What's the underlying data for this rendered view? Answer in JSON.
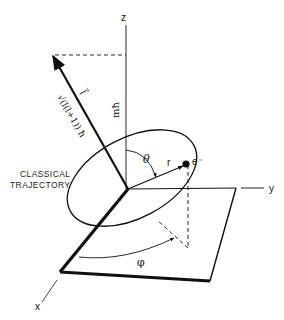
{
  "diagram": {
    "labels": {
      "z_axis": "z",
      "y_axis": "y",
      "x_axis": "x",
      "m_hbar": "mħ",
      "l_vector": "l⃗",
      "l_magnitude": "√(l(l+1)) ħ",
      "l_magnitude_inner": "l(l+1)",
      "hbar": "ħ",
      "theta": "θ",
      "r": "r",
      "electron": "e⁻",
      "phi": "φ",
      "caption_line1": "CLASSICAL",
      "caption_line2": "TRAJECTORY"
    },
    "colors": {
      "ink": "#111111",
      "background": "#ffffff"
    }
  }
}
